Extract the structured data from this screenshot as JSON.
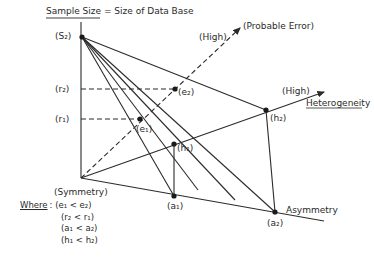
{
  "title": "Sample Size = Size of Data Base",
  "title_underlined_part": "Sample Size",
  "title_rest": " = Size of Data Base",
  "axes": {
    "vertical": {
      "label": "Sample Size = Size of Data Base"
    },
    "probable_error": {
      "label": "(Probable Error)",
      "high_label": "(High)"
    },
    "heterogeneity": {
      "label": "Heterogeneity",
      "high_label": "(High)"
    },
    "asymmetry": {
      "label": "Asymmetry"
    },
    "origin": {
      "label": "(Symmetry)"
    }
  },
  "points": {
    "S2": "(S₂)",
    "r2": "(r₂)",
    "r1": "(r₁)",
    "e2": "(e₂)",
    "e1": "(e₁)",
    "h1": "(h₁)",
    "h2": "(h₂)",
    "a1": "(a₁)",
    "a2": "(a₂)"
  },
  "legend": {
    "heading": "Where",
    "separator": ":",
    "conditions": [
      "(e₁ < e₂)",
      "(r₂ < r₁)",
      "(a₁ < a₂)",
      "(h₁ < h₂)"
    ]
  },
  "colors": {
    "line": "#2b2b2b",
    "text": "#2a2a2a",
    "background": "#ffffff"
  }
}
